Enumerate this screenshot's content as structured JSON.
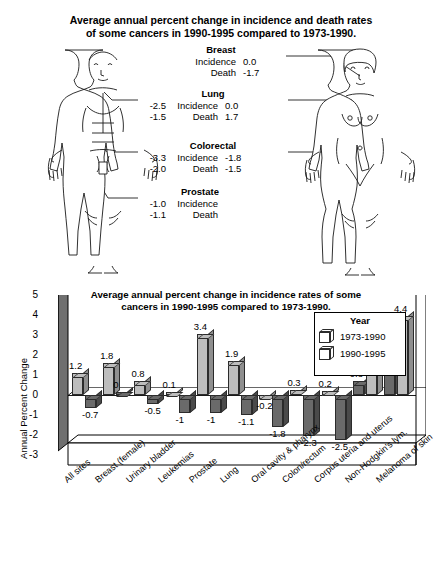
{
  "top_panel": {
    "title": "Average annual percent change in incidence and death rates of some cancers in 1990-1995 compared to 1973-1990.",
    "title_line1": "Average annual percent change in incidence and death rates",
    "title_line2": "of some cancers in 1990-1995 compared to 1973-1990.",
    "male_figure_name": "male-body-diagram",
    "female_figure_name": "female-body-diagram",
    "row_labels": {
      "incidence": "Incidence",
      "death": "Death"
    },
    "callouts": [
      {
        "site": "Breast",
        "male_incidence": "",
        "male_death": "",
        "female_incidence": "0.0",
        "female_death": "-1.7"
      },
      {
        "site": "Lung",
        "male_incidence": "-2.5",
        "male_death": "-1.5",
        "female_incidence": "0.0",
        "female_death": "1.7"
      },
      {
        "site": "Colorectal",
        "male_incidence": "-3.3",
        "male_death": "-2.0",
        "female_incidence": "-1.8",
        "female_death": "-1.5"
      },
      {
        "site": "Prostate",
        "male_incidence": "-1.0",
        "male_death": "-1.1",
        "female_incidence": "",
        "female_death": ""
      }
    ]
  },
  "chart_data": {
    "type": "bar",
    "title": "Average annual percent change in incidence rates of some cancers in 1990-1995 compared to 1973-1990.",
    "title_line1": "Average annual percent change in incidence rates of some",
    "title_line2": "cancers in 1990-1995 compared to 1973-1990.",
    "xlabel": "",
    "ylabel": "Annual Percent Change",
    "ylim": [
      -3,
      5
    ],
    "yticks": [
      "5",
      "4",
      "3",
      "2",
      "1",
      "0",
      "-1",
      "-2",
      "-3"
    ],
    "grid": false,
    "legend_position": "inside-top-center",
    "legend_title": "Year",
    "categories": [
      "All sites",
      "Breast (female)",
      "Urinary bladder",
      "Leukemias",
      "Prostate",
      "Lung",
      "Oral cavity & pharynx",
      "Colon/rectum",
      "Corpus uteria and uterus",
      "Non-Hodgkin's lym.",
      "Melanoma of skin"
    ],
    "series": [
      {
        "name": "1973-1990",
        "color": "#bdbdbd",
        "values": [
          1.2,
          1.8,
          0.8,
          0.1,
          3.4,
          1.9,
          -0.2,
          0.3,
          0.2,
          3.5,
          4.4
        ],
        "labels": [
          "1.2",
          "1.8",
          "0.8",
          "0.1",
          "3.4",
          "1.9",
          "-0.2",
          "0.3",
          "0.2",
          "3.5",
          "4.4"
        ]
      },
      {
        "name": "1990-1995",
        "color": "#6a6a6a",
        "values": [
          -0.7,
          0,
          -0.5,
          -1,
          -1,
          -1.1,
          -1.8,
          -2.3,
          -2.5,
          0.8,
          2.5
        ],
        "labels": [
          "-0.7",
          "0",
          "-0.5",
          "-1",
          "-1",
          "-1.1",
          "-1.8",
          "-2.3",
          "-2.5",
          "0.8",
          "2.5"
        ]
      }
    ]
  }
}
